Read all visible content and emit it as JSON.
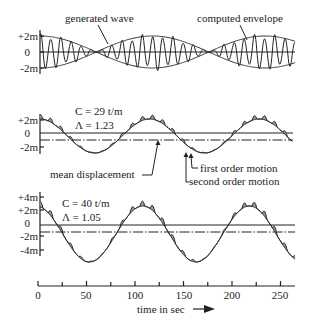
{
  "figure": {
    "panels": [
      {
        "id": "generated-wave",
        "yticks": [
          "+2m",
          "0",
          "-2m"
        ],
        "annotations": [
          "generated wave",
          "computed envelope"
        ]
      },
      {
        "id": "response-c29",
        "params": [
          "C = 29 t/m",
          "Λ = 1.23"
        ],
        "yticks": [
          "+2m",
          "0",
          "-2m"
        ],
        "annotations": [
          "mean displacement",
          "first order motion",
          "second order motion"
        ]
      },
      {
        "id": "response-c40",
        "params": [
          "C = 40 t/m",
          "Λ = 1.05"
        ],
        "yticks": [
          "+4m",
          "+2m",
          "0",
          "-2m",
          "-4m"
        ]
      }
    ],
    "xaxis": {
      "ticks": [
        "0",
        "50",
        "100",
        "150",
        "200",
        "250"
      ],
      "label": "time in sec"
    }
  },
  "chart_data": [
    {
      "type": "line",
      "title": "Generated wave group with computed envelope",
      "xlabel": "time in sec",
      "ylabel": "elevation (m)",
      "xlim": [
        0,
        265
      ],
      "ylim": [
        -3,
        3
      ],
      "yticks": [
        2,
        0,
        -2
      ],
      "series": [
        {
          "name": "generated wave",
          "description": "irregular carrier wave, period ~10 s, amplitude modulated by envelope"
        },
        {
          "name": "computed envelope",
          "x": [
            0,
            40,
            78,
            135,
            193,
            265
          ],
          "values": [
            2.0,
            1.0,
            0.0,
            2.0,
            0.0,
            2.0
          ]
        }
      ]
    },
    {
      "type": "line",
      "title": "Motion response, C = 29 t/m, Λ = 1.23",
      "xlabel": "time in sec",
      "ylabel": "displacement (m)",
      "xlim": [
        0,
        265
      ],
      "ylim": [
        -3,
        2.5
      ],
      "yticks": [
        2,
        0,
        -2
      ],
      "series": [
        {
          "name": "second order motion",
          "x": [
            0,
            25,
            55,
            85,
            115,
            140,
            168,
            235,
            262
          ],
          "values": [
            2.1,
            0.0,
            -2.9,
            -1.2,
            1.9,
            0.3,
            -2.9,
            2.0,
            -1.3
          ]
        },
        {
          "name": "first order motion",
          "description": "high-frequency ripple superposed on second order motion (shaded)"
        },
        {
          "name": "zero line",
          "values": [
            0.0
          ]
        },
        {
          "name": "mean displacement",
          "values": [
            -1.0
          ]
        }
      ]
    },
    {
      "type": "line",
      "title": "Motion response, C = 40 t/m, Λ = 1.05",
      "xlabel": "time in sec",
      "ylabel": "displacement (m)",
      "xlim": [
        0,
        265
      ],
      "ylim": [
        -5.5,
        4.5
      ],
      "yticks": [
        4,
        2,
        0,
        -2,
        -4
      ],
      "series": [
        {
          "name": "second order motion",
          "x": [
            0,
            15,
            50,
            105,
            160,
            215,
            262
          ],
          "values": [
            2.2,
            -0.3,
            -5.5,
            2.4,
            -5.5,
            2.6,
            -4.5
          ]
        },
        {
          "name": "zero line",
          "values": [
            -0.3
          ]
        },
        {
          "name": "mean displacement",
          "values": [
            -1.3
          ]
        }
      ]
    }
  ]
}
